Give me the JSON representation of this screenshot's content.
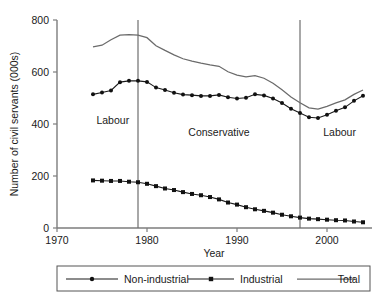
{
  "chart_data": {
    "type": "line",
    "title": "",
    "xlabel": "Year",
    "ylabel": "Number of civil servants (000s)",
    "xlim": [
      1970,
      2005
    ],
    "ylim": [
      0,
      800
    ],
    "xticks": [
      1970,
      1980,
      1990,
      2000
    ],
    "yticks": [
      0,
      200,
      400,
      600,
      800
    ],
    "grid": false,
    "legend_position": "bottom",
    "x": [
      1974,
      1975,
      1976,
      1977,
      1978,
      1979,
      1980,
      1981,
      1982,
      1983,
      1984,
      1985,
      1986,
      1987,
      1988,
      1989,
      1990,
      1991,
      1992,
      1993,
      1994,
      1995,
      1996,
      1997,
      1998,
      1999,
      2000,
      2001,
      2002,
      2003,
      2004
    ],
    "series": [
      {
        "name": "Non-industrial",
        "marker": "circle",
        "values": [
          514,
          521,
          529,
          561,
          566,
          566,
          562,
          540,
          531,
          520,
          513,
          511,
          508,
          508,
          512,
          503,
          498,
          501,
          514,
          510,
          498,
          481,
          459,
          442,
          426,
          423,
          436,
          451,
          464,
          489,
          509
        ]
      },
      {
        "name": "Industrial",
        "marker": "square",
        "values": [
          183,
          182,
          181,
          181,
          178,
          176,
          170,
          161,
          152,
          146,
          138,
          131,
          126,
          119,
          110,
          98,
          90,
          80,
          72,
          66,
          59,
          51,
          45,
          40,
          36,
          34,
          32,
          30,
          29,
          25,
          22
        ]
      },
      {
        "name": "Total",
        "marker": "none",
        "values": [
          697,
          703,
          724,
          742,
          744,
          742,
          732,
          701,
          683,
          666,
          651,
          642,
          634,
          627,
          622,
          601,
          588,
          581,
          586,
          576,
          557,
          532,
          504,
          482,
          462,
          457,
          468,
          481,
          493,
          514,
          531
        ]
      }
    ],
    "annotations": [
      {
        "label": "Labour",
        "x": 1976.2,
        "y": 400
      },
      {
        "label": "Conservative",
        "x": 1988.0,
        "y": 355
      },
      {
        "label": "Labour",
        "x": 2001.4,
        "y": 355
      }
    ],
    "dividers": [
      {
        "x": 1979,
        "label": ""
      },
      {
        "x": 1997,
        "label": ""
      }
    ]
  },
  "legend": {
    "entries": [
      {
        "label": "Non-industrial",
        "marker": "circle-marker"
      },
      {
        "label": "Industrial",
        "marker": "square-marker"
      },
      {
        "label": "Total",
        "marker": "plain-line"
      }
    ]
  },
  "colors": {
    "total_line": "#6b6b6b",
    "marked_line": "#1a1a1a",
    "marker_fill": "#111111",
    "axis": "#7d7d7d",
    "divider": "#6e6e6e",
    "legend_border": "#555555",
    "text": "#1a1a1a",
    "background": "#ffffff"
  }
}
